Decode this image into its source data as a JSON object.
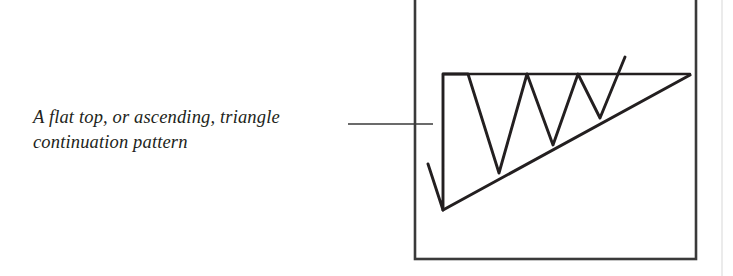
{
  "page": {
    "width": 733,
    "height": 276,
    "background": "#ffffff",
    "ink_color": "#231f20"
  },
  "caption": {
    "text": "A flat top, or ascending, triangle\ncontinuation pattern",
    "line_1": "A flat top, or ascending, triangle",
    "line_2": "continuation pattern",
    "style": "italic-serif",
    "color": "#231f20"
  },
  "leader_line": {
    "name": "caption-leader-line",
    "x1": 348,
    "y1": 124,
    "x2": 433,
    "y2": 124,
    "color": "#3a3a3a",
    "width": 1.4
  },
  "frame": {
    "name": "figure-frame",
    "x": 415,
    "y": -14,
    "width": 281,
    "height": 273,
    "color": "#3a3a3a",
    "stroke_width": 2.6
  },
  "scan_edge": {
    "name": "page-scan-edge",
    "x": 722,
    "color": "#e6e6e6"
  },
  "chart_data": {
    "type": "line",
    "xlabel": "",
    "ylabel": "",
    "grid": false,
    "legend": null,
    "note": "Schematic stock-chart drawing. Coordinates are in screenshot pixel space; y increases downward, so lower y = higher price.",
    "xlim": [
      415,
      696
    ],
    "ylim": [
      259,
      -14
    ],
    "series": [
      {
        "name": "price-zigzag",
        "description": "Entry down-move into the pattern, then three rallies to resistance with higher lows, then the upside breakout.",
        "points": [
          [
            428,
            164
          ],
          [
            443,
            210
          ],
          [
            443,
            74
          ],
          [
            468,
            74
          ],
          [
            499,
            173
          ],
          [
            527,
            74
          ],
          [
            553,
            145
          ],
          [
            578,
            74
          ],
          [
            600,
            118
          ],
          [
            625,
            57
          ]
        ]
      },
      {
        "name": "flat-top-resistance",
        "description": "Horizontal resistance line across the three equal highs.",
        "points": [
          [
            443,
            74
          ],
          [
            690,
            74
          ]
        ]
      },
      {
        "name": "rising-support-trendline",
        "description": "Up-sloping support line connecting the rising lows, converging on the flat top.",
        "points": [
          [
            443,
            210
          ],
          [
            690,
            75
          ]
        ]
      }
    ],
    "annotations": [
      {
        "name": "pattern-label",
        "text": "A flat top, or ascending, triangle continuation pattern",
        "x": 33,
        "y": 124
      }
    ]
  }
}
